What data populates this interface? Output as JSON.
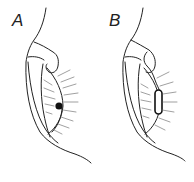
{
  "figure": {
    "panels": [
      {
        "label": "A",
        "feature": "punctal-dot"
      },
      {
        "label": "B",
        "feature": "canalicular-plug"
      }
    ],
    "colors": {
      "line": "#222222",
      "lash": "#777777",
      "background": "#ffffff"
    }
  }
}
